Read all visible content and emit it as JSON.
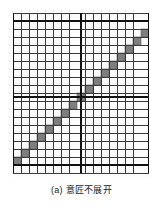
{
  "figure": {
    "caption": "(a) 意匠不展开",
    "caption_label": "(a)",
    "caption_text": "意匠不展开",
    "type": "weave-point-paper-diagram",
    "background_color": "#ffffff"
  },
  "grid": {
    "columns": 17,
    "rows": 20,
    "cell_width": 8,
    "cell_height": 8,
    "origin_x": 0,
    "origin_y": 0,
    "thin_line_color": "#3a3a3a",
    "thin_line_width": 1,
    "thick_line_color": "#111111",
    "thick_line_width": 2.2,
    "cell_fill_color": "#fbfbfb",
    "thick_vertical_columns": [
      1,
      9,
      17
    ],
    "thick_horizontal_rows": [
      1,
      11,
      19
    ]
  },
  "marks": {
    "fill_color": "#7e7e7e",
    "stroke_color": "#5d5d5d",
    "description": "diagonal twill float squares rising left-to-right",
    "cells": [
      {
        "col": 1,
        "row": 19
      },
      {
        "col": 2,
        "row": 18
      },
      {
        "col": 3,
        "row": 17
      },
      {
        "col": 4,
        "row": 16
      },
      {
        "col": 5,
        "row": 15
      },
      {
        "col": 6,
        "row": 14
      },
      {
        "col": 7,
        "row": 13
      },
      {
        "col": 8,
        "row": 12
      },
      {
        "col": 9,
        "row": 11
      },
      {
        "col": 10,
        "row": 10
      },
      {
        "col": 11,
        "row": 9
      },
      {
        "col": 12,
        "row": 8
      },
      {
        "col": 13,
        "row": 7
      },
      {
        "col": 14,
        "row": 6
      },
      {
        "col": 15,
        "row": 5
      },
      {
        "col": 16,
        "row": 4
      },
      {
        "col": 17,
        "row": 3
      }
    ]
  },
  "chart_data": {
    "type": "heatmap",
    "title": "(a) 意匠不展开",
    "xlabel": "",
    "ylabel": "",
    "nx": 17,
    "ny": 20,
    "legend": [],
    "values_description": "1 = filled (warp float), 0 = empty; filled cells form a single straight diagonal line",
    "filled_cells": [
      [
        1,
        19
      ],
      [
        2,
        18
      ],
      [
        3,
        17
      ],
      [
        4,
        16
      ],
      [
        5,
        15
      ],
      [
        6,
        14
      ],
      [
        7,
        13
      ],
      [
        8,
        12
      ],
      [
        9,
        11
      ],
      [
        10,
        10
      ],
      [
        11,
        9
      ],
      [
        12,
        8
      ],
      [
        13,
        7
      ],
      [
        14,
        6
      ],
      [
        15,
        5
      ],
      [
        16,
        4
      ],
      [
        17,
        3
      ]
    ]
  }
}
